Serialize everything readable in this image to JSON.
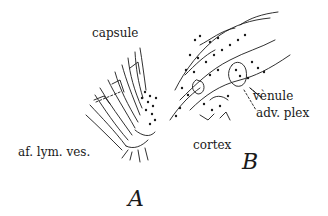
{
  "figure": {
    "panel_a": {
      "letter": "A",
      "labels": {
        "capsule": "capsule",
        "afferent": "af. lym. ves."
      }
    },
    "panel_b": {
      "letter": "B",
      "labels": {
        "venule": "vènule",
        "adv_plex": "adv. plex",
        "cortex": "cortex"
      }
    },
    "colors": {
      "ink": "#1a1a1a",
      "background": "#ffffff"
    }
  }
}
